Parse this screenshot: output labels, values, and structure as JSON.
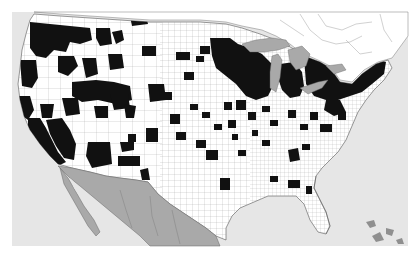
{
  "map": {
    "type": "county-choropleth",
    "region": "contiguous United States with adjacent Canada and Mexico",
    "legend": null,
    "title": null,
    "colors": {
      "background_ocean": "#e6e6e6",
      "us_land": "#ffffff",
      "highlighted_counties": "#111111",
      "county_borders": "#6a6a6a",
      "canada_land": "#ffffff",
      "mexico_land": "#a9a9a9",
      "great_lakes": "#a9a9a9",
      "caribbean_islands": "#8f8f8f"
    },
    "highlighted_regions": [
      "Washington / Oregon / Idaho northwest block",
      "California coast and Sierra",
      "Nevada / Utah / Oregon interior clusters",
      "Arizona / New Mexico clusters",
      "Minnesota / Wisconsin / Michigan Upper Peninsula",
      "Lower Michigan",
      "New York / Pennsylvania / New England",
      "Scattered counties in Plains, South and Southeast"
    ]
  }
}
